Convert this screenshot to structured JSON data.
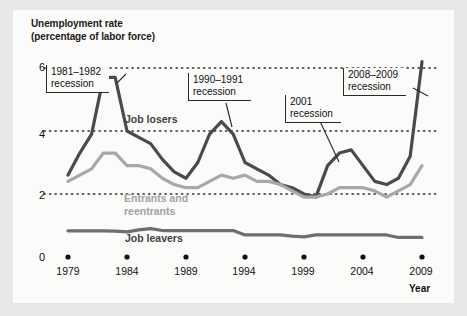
{
  "title": {
    "line1": "Unemployment rate",
    "line2": "(percentage of labor force)"
  },
  "axis": {
    "x_title": "Year",
    "y_ticks": [
      "6",
      "4",
      "2",
      "0"
    ],
    "x_ticks": [
      "1979",
      "1984",
      "1989",
      "1994",
      "1999",
      "2004",
      "2009"
    ]
  },
  "series_labels": {
    "job_losers": "Job losers",
    "entrants_line1": "Entrants and",
    "entrants_line2": "reentrants",
    "job_leavers": "Job leavers"
  },
  "callouts": [
    {
      "line1": "1981–1982",
      "line2": "recession"
    },
    {
      "line1": "1990–1991",
      "line2": "recession"
    },
    {
      "line1": "2001",
      "line2": "recession"
    },
    {
      "line1": "2008–2009",
      "line2": "recession"
    }
  ],
  "colors": {
    "job_losers": "#4a4a4a",
    "entrants": "#a8a8a8",
    "job_leavers": "#6e6e6e",
    "gridline": "#2b2b2b",
    "background": "#fbfbfa",
    "page": "#e8e8e6"
  },
  "chart_data": {
    "type": "line",
    "title": "Unemployment rate (percentage of labor force)",
    "xlabel": "Year",
    "ylabel": "Unemployment rate (percentage of labor force)",
    "xlim": [
      1979,
      2009
    ],
    "ylim": [
      0,
      6.4
    ],
    "yticks": [
      0,
      2,
      4,
      6
    ],
    "xticks": [
      1979,
      1984,
      1989,
      1994,
      1999,
      2004,
      2009
    ],
    "grid": "horizontal-dotted",
    "legend": "inline-labels",
    "x": [
      1979,
      1980,
      1981,
      1982,
      1983,
      1984,
      1985,
      1986,
      1987,
      1988,
      1989,
      1990,
      1991,
      1992,
      1993,
      1994,
      1995,
      1996,
      1997,
      1998,
      1999,
      2000,
      2001,
      2002,
      2003,
      2004,
      2005,
      2006,
      2007,
      2008,
      2009
    ],
    "series": [
      {
        "name": "Job losers",
        "color": "#4a4a4a",
        "values": [
          2.6,
          3.3,
          3.9,
          5.7,
          5.7,
          4.0,
          3.8,
          3.6,
          3.1,
          2.7,
          2.5,
          3.0,
          3.9,
          4.3,
          3.9,
          3.0,
          2.8,
          2.6,
          2.3,
          2.2,
          2.0,
          1.9,
          2.9,
          3.3,
          3.4,
          2.9,
          2.4,
          2.3,
          2.5,
          3.2,
          6.2
        ]
      },
      {
        "name": "Entrants and reentrants",
        "color": "#a8a8a8",
        "values": [
          2.4,
          2.6,
          2.8,
          3.3,
          3.3,
          2.9,
          2.9,
          2.8,
          2.5,
          2.3,
          2.2,
          2.2,
          2.4,
          2.6,
          2.5,
          2.6,
          2.4,
          2.4,
          2.3,
          2.1,
          1.9,
          1.9,
          2.0,
          2.2,
          2.2,
          2.2,
          2.1,
          1.9,
          2.1,
          2.3,
          2.9
        ]
      },
      {
        "name": "Job leavers",
        "color": "#6e6e6e",
        "values": [
          0.83,
          0.83,
          0.83,
          0.83,
          0.82,
          0.8,
          0.86,
          0.9,
          0.84,
          0.84,
          0.84,
          0.84,
          0.84,
          0.84,
          0.84,
          0.7,
          0.7,
          0.7,
          0.7,
          0.66,
          0.64,
          0.7,
          0.7,
          0.7,
          0.7,
          0.7,
          0.7,
          0.7,
          0.62,
          0.62,
          0.62
        ]
      }
    ],
    "annotations": [
      {
        "text": "1981–1982 recession",
        "x": 1982
      },
      {
        "text": "1990–1991 recession",
        "x": 1992
      },
      {
        "text": "2001 recession",
        "x": 2002
      },
      {
        "text": "2008–2009 recession",
        "x": 2009
      }
    ]
  }
}
